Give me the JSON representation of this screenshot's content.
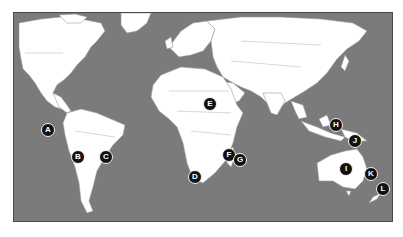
{
  "map": {
    "type": "world-political-outline",
    "colors": {
      "ocean": "#7b7b7b",
      "land": "#ffffff",
      "borders": "#9a9a9a",
      "marker_fill": "#111111",
      "marker_text": "#ffffff"
    }
  },
  "markers": [
    {
      "label": "A",
      "x": 48,
      "y": 130
    },
    {
      "label": "B",
      "x": 78,
      "y": 157
    },
    {
      "label": "C",
      "x": 106,
      "y": 157
    },
    {
      "label": "D",
      "x": 195,
      "y": 177
    },
    {
      "label": "E",
      "x": 210,
      "y": 104
    },
    {
      "label": "F",
      "x": 229,
      "y": 155
    },
    {
      "label": "G",
      "x": 240,
      "y": 160
    },
    {
      "label": "H",
      "x": 336,
      "y": 125
    },
    {
      "label": "I",
      "x": 346,
      "y": 169
    },
    {
      "label": "J",
      "x": 355,
      "y": 141
    },
    {
      "label": "K",
      "x": 371,
      "y": 174
    },
    {
      "label": "L",
      "x": 383,
      "y": 189
    }
  ]
}
